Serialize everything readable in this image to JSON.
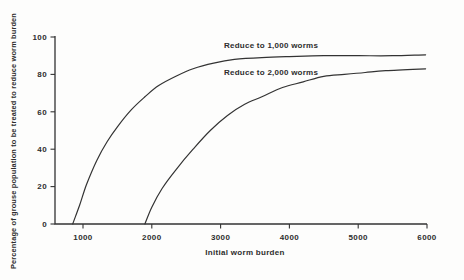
{
  "figure": {
    "background_color": "#fdfdfc",
    "line_color": "#333333",
    "text_color": "#2d2d2d"
  },
  "chart_data": {
    "type": "line",
    "title": "",
    "xlabel": "Initial worm burden",
    "ylabel": "Percentage of grouse population to be treated to reduce worm burden",
    "xlim": [
      600,
      6000
    ],
    "ylim": [
      0,
      100
    ],
    "grid": false,
    "legend_position": "inline-labels-above-curves",
    "x_ticks": [
      1000,
      2000,
      3000,
      4000,
      5000,
      6000
    ],
    "x_tick_labels": [
      "1000",
      "2000",
      "3000",
      "4000",
      "5000",
      "6000"
    ],
    "y_ticks": [
      0,
      20,
      40,
      60,
      80,
      100
    ],
    "y_tick_labels": [
      "0",
      "20",
      "40",
      "60",
      "80",
      "100"
    ],
    "series": [
      {
        "name": "Reduce to 1,000 worms",
        "points": [
          [
            850,
            0
          ],
          [
            950,
            10
          ],
          [
            1050,
            21
          ],
          [
            1200,
            34
          ],
          [
            1350,
            44
          ],
          [
            1500,
            52
          ],
          [
            1700,
            61
          ],
          [
            1900,
            68
          ],
          [
            2100,
            74
          ],
          [
            2350,
            79
          ],
          [
            2600,
            83
          ],
          [
            2900,
            86
          ],
          [
            3200,
            88
          ],
          [
            3600,
            89
          ],
          [
            4000,
            89.5
          ],
          [
            4500,
            90
          ],
          [
            5000,
            90
          ],
          [
            5500,
            90
          ],
          [
            5980,
            90.5
          ]
        ]
      },
      {
        "name": "Reduce to 2,000 worms",
        "points": [
          [
            1900,
            0
          ],
          [
            2000,
            9
          ],
          [
            2150,
            19
          ],
          [
            2350,
            29
          ],
          [
            2600,
            40
          ],
          [
            2850,
            50
          ],
          [
            3100,
            58
          ],
          [
            3350,
            64
          ],
          [
            3600,
            68
          ],
          [
            3900,
            73
          ],
          [
            4200,
            76
          ],
          [
            4500,
            79
          ],
          [
            4800,
            80
          ],
          [
            5100,
            81
          ],
          [
            5400,
            82
          ],
          [
            5980,
            83
          ]
        ]
      }
    ]
  }
}
